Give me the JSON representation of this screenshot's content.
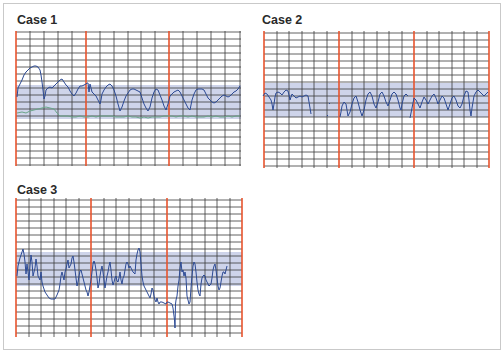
{
  "panels": [
    {
      "title": "Case 1",
      "traces": [
        "fetal-heart-rate",
        "secondary-trace"
      ]
    },
    {
      "title": "Case 2",
      "traces": [
        "fetal-heart-rate"
      ]
    },
    {
      "title": "Case 3",
      "traces": [
        "fetal-heart-rate"
      ]
    }
  ],
  "colors": {
    "grid_minor": "#333333",
    "grid_major": "#e8542e",
    "normal_band": "#c5cde6",
    "trace_primary": "#2c4a94",
    "trace_secondary": "#6aa58a",
    "border": "#c9c9c9"
  }
}
